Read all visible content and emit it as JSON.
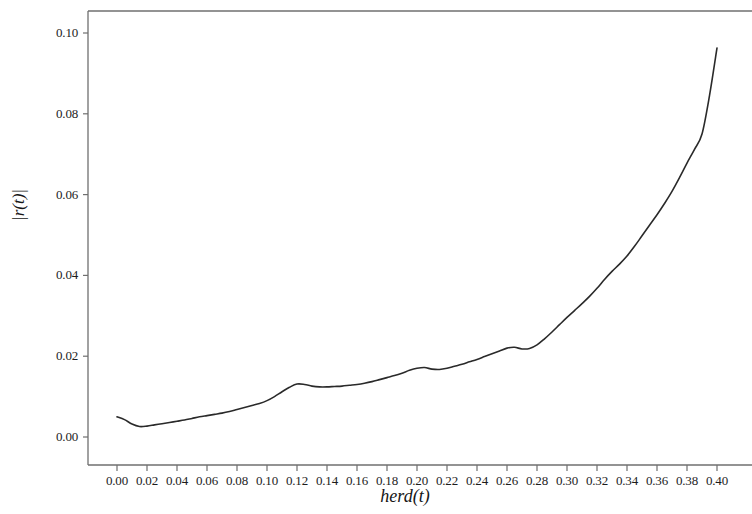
{
  "chart_data": {
    "type": "line",
    "title": "",
    "subtitle": "",
    "xlabel": "herd(t)",
    "ylabel": "|r(t)|",
    "xlim": [
      -0.012,
      0.423
    ],
    "ylim": [
      -0.0015,
      0.1063
    ],
    "grid": false,
    "legend": null,
    "x_ticks": [
      0.0,
      0.02,
      0.04,
      0.06,
      0.08,
      0.1,
      0.12,
      0.14,
      0.16,
      0.18,
      0.2,
      0.22,
      0.24,
      0.26,
      0.28,
      0.3,
      0.32,
      0.34,
      0.36,
      0.38,
      0.4
    ],
    "x_tick_labels": [
      "0.00",
      "0.02",
      "0.04",
      "0.06",
      "0.08",
      "0.10",
      "0.12",
      "0.14",
      "0.16",
      "0.18",
      "0.20",
      "0.22",
      "0.24",
      "0.26",
      "0.28",
      "0.30",
      "0.32",
      "0.34",
      "0.36",
      "0.38",
      "0.40"
    ],
    "y_ticks": [
      0.0,
      0.02,
      0.04,
      0.06,
      0.08,
      0.1
    ],
    "y_tick_labels": [
      "0.00",
      "0.02",
      "0.04",
      "0.06",
      "0.08",
      "0.10"
    ],
    "line_color": "#2a2a2a",
    "line_width": 1.6,
    "series": [
      {
        "name": "|r(t)| vs herd(t)",
        "x": [
          0.0,
          0.005,
          0.01,
          0.015,
          0.02,
          0.025,
          0.03,
          0.035,
          0.04,
          0.045,
          0.05,
          0.055,
          0.06,
          0.065,
          0.07,
          0.075,
          0.08,
          0.085,
          0.09,
          0.095,
          0.1,
          0.105,
          0.11,
          0.115,
          0.12,
          0.125,
          0.13,
          0.135,
          0.14,
          0.145,
          0.15,
          0.155,
          0.16,
          0.165,
          0.17,
          0.175,
          0.18,
          0.185,
          0.19,
          0.195,
          0.2,
          0.205,
          0.21,
          0.215,
          0.22,
          0.225,
          0.23,
          0.235,
          0.24,
          0.245,
          0.25,
          0.255,
          0.26,
          0.265,
          0.27,
          0.275,
          0.28,
          0.285,
          0.29,
          0.295,
          0.3,
          0.305,
          0.31,
          0.315,
          0.32,
          0.325,
          0.33,
          0.335,
          0.34,
          0.345,
          0.35,
          0.355,
          0.36,
          0.365,
          0.37,
          0.375,
          0.38,
          0.385,
          0.39,
          0.395,
          0.4
        ],
        "y": [
          0.005,
          0.0043,
          0.0032,
          0.0026,
          0.0027,
          0.003,
          0.0033,
          0.0036,
          0.0039,
          0.0042,
          0.0046,
          0.005,
          0.0053,
          0.0056,
          0.0059,
          0.0063,
          0.0068,
          0.0073,
          0.0078,
          0.0083,
          0.009,
          0.01,
          0.0112,
          0.0123,
          0.0131,
          0.013,
          0.0126,
          0.0124,
          0.0124,
          0.0125,
          0.0126,
          0.0128,
          0.013,
          0.0133,
          0.0137,
          0.0142,
          0.0147,
          0.0152,
          0.0158,
          0.0165,
          0.017,
          0.0172,
          0.0168,
          0.0167,
          0.017,
          0.0175,
          0.018,
          0.0186,
          0.0192,
          0.0199,
          0.0206,
          0.0213,
          0.022,
          0.0222,
          0.0218,
          0.0219,
          0.0228,
          0.0243,
          0.026,
          0.0278,
          0.0296,
          0.0313,
          0.033,
          0.0348,
          0.0368,
          0.039,
          0.041,
          0.0428,
          0.0448,
          0.0472,
          0.0498,
          0.0524,
          0.055,
          0.0578,
          0.0608,
          0.0642,
          0.0678,
          0.0712,
          0.075,
          0.0845,
          0.0963
        ]
      }
    ]
  },
  "figure": {
    "background_color": "#ffffff",
    "frame_color": "#6f6f6f"
  }
}
